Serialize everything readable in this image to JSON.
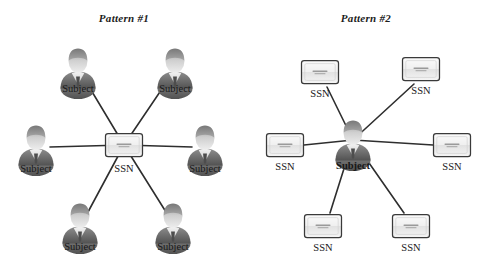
{
  "figure": {
    "background": "#ffffff",
    "line_color": "#2e2e2e"
  },
  "panels": [
    {
      "id": "pattern-1",
      "title": "Pattern #1",
      "title_x": 124,
      "title_y": 22,
      "center": {
        "type": "card",
        "label": "SSN",
        "x": 124,
        "y": 145,
        "label_x": 124,
        "label_y": 172
      },
      "nodes": [
        {
          "type": "person",
          "label": "Subject",
          "x": 78,
          "y": 68,
          "label_x": 78,
          "label_y": 92
        },
        {
          "type": "person",
          "label": "Subject",
          "x": 175,
          "y": 68,
          "label_x": 175,
          "label_y": 92
        },
        {
          "type": "person",
          "label": "Subject",
          "x": 36,
          "y": 145,
          "label_x": 36,
          "label_y": 172
        },
        {
          "type": "person",
          "label": "Subject",
          "x": 205,
          "y": 145,
          "label_x": 205,
          "label_y": 172
        },
        {
          "type": "person",
          "label": "Subject",
          "x": 80,
          "y": 223,
          "label_x": 80,
          "label_y": 250
        },
        {
          "type": "person",
          "label": "Subject",
          "x": 173,
          "y": 223,
          "label_x": 173,
          "label_y": 250
        }
      ]
    },
    {
      "id": "pattern-2",
      "title": "Pattern #2",
      "title_x": 366,
      "title_y": 22,
      "center": {
        "type": "person",
        "label": "Subject",
        "x": 353,
        "y": 140,
        "label_x": 353,
        "label_y": 169
      },
      "nodes": [
        {
          "type": "card",
          "label": "SSN",
          "x": 320,
          "y": 72,
          "label_x": 320,
          "label_y": 97
        },
        {
          "type": "card",
          "label": "SSN",
          "x": 421,
          "y": 69,
          "label_x": 421,
          "label_y": 94
        },
        {
          "type": "card",
          "label": "SSN",
          "x": 285,
          "y": 145,
          "label_x": 285,
          "label_y": 170
        },
        {
          "type": "card",
          "label": "SSN",
          "x": 452,
          "y": 145,
          "label_x": 452,
          "label_y": 170
        },
        {
          "type": "card",
          "label": "SSN",
          "x": 323,
          "y": 226,
          "label_x": 323,
          "label_y": 251
        },
        {
          "type": "card",
          "label": "SSN",
          "x": 411,
          "y": 226,
          "label_x": 411,
          "label_y": 251
        }
      ]
    }
  ],
  "card_caption": "000-00-0000"
}
